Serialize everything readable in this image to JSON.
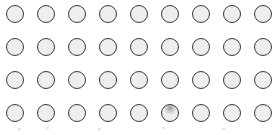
{
  "board": {
    "rows": 4,
    "cols": 9,
    "origin_x": 6,
    "origin_y": 5,
    "spacing_x": 31,
    "spacing_y": 33,
    "colors": {
      "fill": "#eeeeee",
      "border": "#3a3a3a",
      "shaded": "#9a9a9a",
      "background": "#ffffff"
    },
    "shaded_cells": [
      [
        3,
        5
      ]
    ]
  },
  "footer_marks": [
    18,
    46,
    98,
    162,
    222
  ]
}
